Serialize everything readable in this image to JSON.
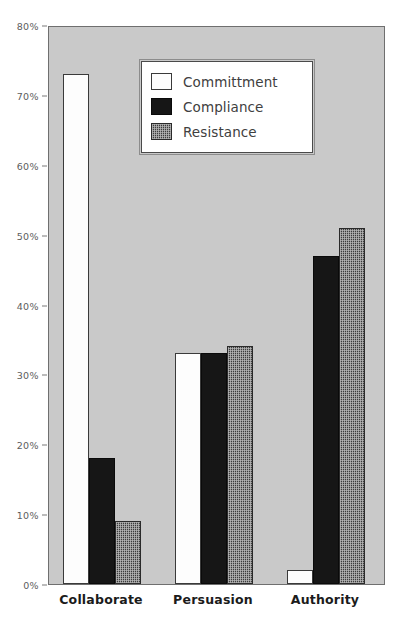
{
  "chart_data": {
    "type": "bar",
    "title": "",
    "subtitle": "",
    "xlabel": "",
    "ylabel": "",
    "categories": [
      "Collaborate",
      "Persuasion",
      "Authority"
    ],
    "series": [
      {
        "name": "Committment",
        "values": [
          73,
          33,
          2
        ],
        "fill": "white",
        "color": "#fdfdfd"
      },
      {
        "name": "Compliance",
        "values": [
          18,
          33,
          47
        ],
        "fill": "solid-dark",
        "color": "#161616"
      },
      {
        "name": "Resistance",
        "values": [
          9,
          34,
          51
        ],
        "fill": "checkered",
        "color": "#3c3c3c"
      }
    ],
    "ylim": [
      0,
      80
    ],
    "ytick_values": [
      0,
      10,
      20,
      30,
      40,
      50,
      60,
      70,
      80
    ],
    "ytick_labels": [
      "0%",
      "10%",
      "20%",
      "30%",
      "40%",
      "50%",
      "60%",
      "70%",
      "80%"
    ],
    "grid": false,
    "legend_position": "upper-center-left",
    "plot_background": "#c9c9c9",
    "page_background": "#ffffff",
    "axis_color": "#6f6f6f",
    "tick_label_color": "#5c5c5c",
    "category_label_color": "#1b1b1b"
  },
  "legend": {
    "entries": [
      {
        "label": "Committment"
      },
      {
        "label": "Compliance"
      },
      {
        "label": "Resistance"
      }
    ]
  }
}
